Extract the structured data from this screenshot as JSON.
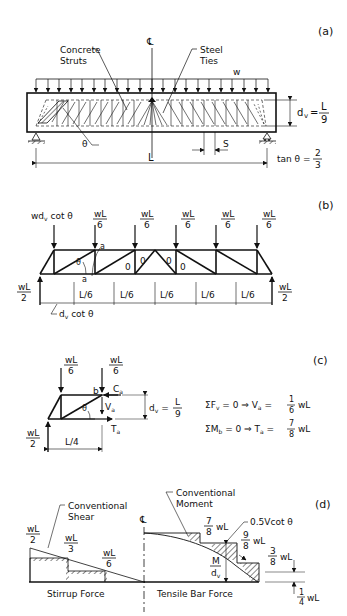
{
  "panels": {
    "a": {
      "label": "(a)",
      "centerline": "℄",
      "concrete_struts_line1": "Concrete",
      "concrete_struts_line2": "Struts",
      "steel_ties_line1": "Steel",
      "steel_ties_line2": "Ties",
      "load": "w",
      "dv_lhs": "d",
      "dv_sub": "v",
      "dv_eq": "=",
      "dv_num": "L",
      "dv_den": "9",
      "theta": "θ",
      "span": "L",
      "spacing": "S",
      "tan_lhs": "tan θ =",
      "tan_num": "2",
      "tan_den": "3"
    },
    "b": {
      "label": "(b)",
      "first_load": "wd",
      "first_load_sub": "v",
      "first_load_tail": " cot θ",
      "node_load_num": "wL",
      "node_load_den": "6",
      "reaction_num": "wL",
      "reaction_den": "2",
      "section": "a",
      "theta": "θ",
      "zero": "0",
      "panel_width": "L/6",
      "end_dim": "d",
      "end_dim_sub": "v",
      "end_dim_tail": " cot θ"
    },
    "c": {
      "label": "(c)",
      "load_num": "wL",
      "load_den": "6",
      "reaction_num": "wL",
      "reaction_den": "2",
      "node_b": "b",
      "Ca": "C",
      "Ca_sub": "a",
      "Va": "V",
      "Va_sub": "a",
      "Ta": "T",
      "Ta_sub": "a",
      "theta": "θ",
      "dv_lhs": "d",
      "dv_sub": "v",
      "dv_num": "L",
      "dv_den": "9",
      "length": "L/4",
      "eq1_lhs": "ΣF",
      "eq1_sub": "v",
      "eq1_mid": " = 0  ⇒  V",
      "eq1_sub2": "a",
      "eq1_eq": " = ",
      "eq1_num": "1",
      "eq1_den": "6",
      "eq1_tail": "wL",
      "eq2_lhs": "ΣM",
      "eq2_sub": "b",
      "eq2_mid": " = 0  ⇒  T",
      "eq2_sub2": "a",
      "eq2_eq": " = ",
      "eq2_num": "7",
      "eq2_den": "8",
      "eq2_tail": "wL"
    },
    "d": {
      "label": "(d)",
      "conv_shear_1": "Conventional",
      "conv_shear_2": "Shear",
      "conv_moment_1": "Conventional",
      "conv_moment_2": "Moment",
      "centerline": "℄",
      "shear_wl2_num": "wL",
      "shear_wl2_den": "2",
      "shear_wl3_num": "wL",
      "shear_wl3_den": "3",
      "shear_wl6_num": "wL",
      "shear_wl6_den": "6",
      "stirrup_force": "Stirrup Force",
      "tensile_bar_force": "Tensile Bar Force",
      "m78_num": "7",
      "m78_den": "8",
      "m98_num": "9",
      "m98_den": "8",
      "m38_num": "3",
      "m38_den": "8",
      "m14_num": "1",
      "m14_den": "4",
      "wl": "wL",
      "vcot": "0.5Vcot θ",
      "m_num": "M",
      "m_den": "d",
      "m_den_sub": "v"
    }
  }
}
